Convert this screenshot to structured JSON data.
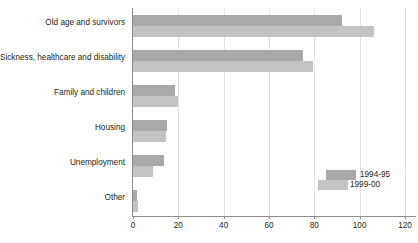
{
  "chart_data": {
    "type": "bar",
    "orientation": "horizontal",
    "title": "",
    "xlabel": "",
    "ylabel": "",
    "categories": [
      "Old age and survivors",
      "Sickness, healthcare and disability",
      "Family and children",
      "Housing",
      "Unemployment",
      "Other"
    ],
    "series": [
      {
        "name": "1994-95",
        "color": "#a9a9a9",
        "values": [
          92,
          75,
          18.5,
          15,
          13.7,
          1.8
        ]
      },
      {
        "name": "1999-00",
        "color": "#c3c3c3",
        "values": [
          106.5,
          79.5,
          20,
          14.5,
          9,
          2
        ]
      }
    ],
    "xlim": [
      0,
      120
    ],
    "xticks": [
      0,
      20,
      40,
      60,
      80,
      100,
      120
    ],
    "xtick_labels": [
      "0",
      "20",
      "40",
      "60",
      "80",
      "100",
      "120"
    ],
    "grid": true,
    "grid_axis": "x",
    "legend_position": "bottom-right"
  },
  "legend": {
    "entries": [
      {
        "label": "1994-95"
      },
      {
        "label": "1999-00"
      }
    ]
  }
}
